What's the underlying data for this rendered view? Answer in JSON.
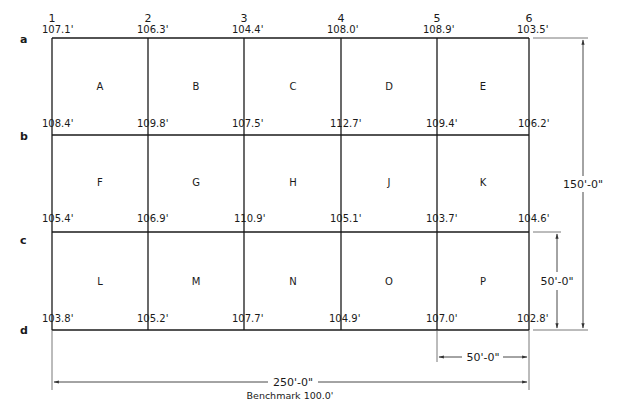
{
  "columns": [
    {
      "label": "1",
      "x": 52
    },
    {
      "label": "2",
      "x": 148
    },
    {
      "label": "3",
      "x": 244
    },
    {
      "label": "4",
      "x": 341
    },
    {
      "label": "5",
      "x": 437
    },
    {
      "label": "6",
      "x": 529
    }
  ],
  "rows": [
    {
      "label": "a",
      "y": 38
    },
    {
      "label": "b",
      "y": 135
    },
    {
      "label": "c",
      "y": 232
    },
    {
      "label": "d",
      "y": 330
    }
  ],
  "elevations": {
    "a": [
      "107.1'",
      "106.3'",
      "104.4'",
      "108.0'",
      "108.9'",
      "103.5'"
    ],
    "b": [
      "108.4'",
      "109.8'",
      "107.5'",
      "112.7'",
      "109.4'",
      "106.2'"
    ],
    "c": [
      "105.4'",
      "106.9'",
      "110.9'",
      "105.1'",
      "103.7'",
      "104.6'"
    ],
    "d": [
      "103.8'",
      "105.2'",
      "107.7'",
      "104.9'",
      "107.0'",
      "102.8'"
    ]
  },
  "cells": [
    [
      "A",
      "B",
      "C",
      "D",
      "E"
    ],
    [
      "F",
      "G",
      "H",
      "J",
      "K"
    ],
    [
      "L",
      "M",
      "N",
      "O",
      "P"
    ]
  ],
  "dimensions": {
    "total_width": "250'-0\"",
    "total_height": "150'-0\"",
    "cell_width": "50'-0\"",
    "cell_height": "50'-0\""
  },
  "benchmark": "Benchmark 100.0'",
  "colors": {
    "line": "#1a1a1a",
    "dimension": "#333333",
    "background": "#ffffff"
  }
}
